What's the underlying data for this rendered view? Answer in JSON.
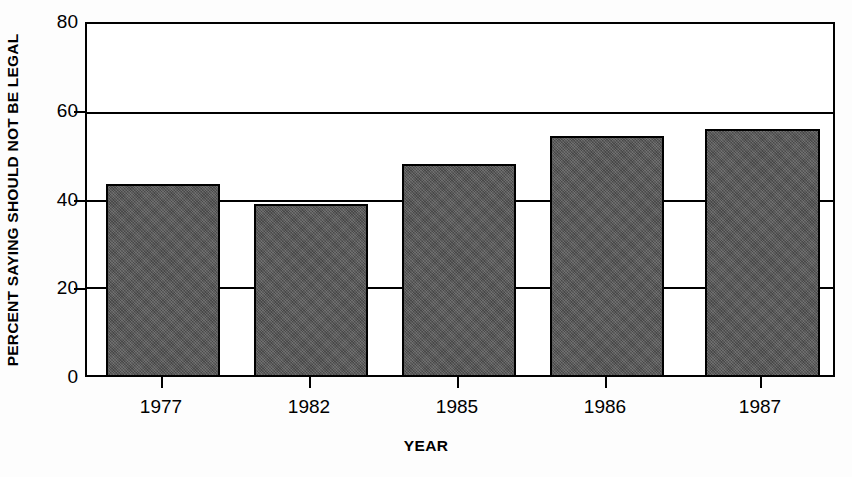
{
  "chart_data": {
    "type": "bar",
    "title": "",
    "categories": [
      "1977",
      "1982",
      "1985",
      "1986",
      "1987"
    ],
    "values": [
      43.5,
      39,
      48,
      54.5,
      56
    ],
    "xlabel": "YEAR",
    "ylabel": "PERCENT SAYING SHOULD NOT BE LEGAL",
    "ylim": [
      0,
      80
    ],
    "yticks": [
      0,
      20,
      40,
      60,
      80
    ],
    "ytick_labels": [
      "0",
      "20",
      "40",
      "60",
      "80"
    ],
    "gridlines": [
      20,
      40,
      60
    ],
    "grid": true,
    "legend": null,
    "bar_color": "#555555",
    "bar_edge_color": "#000000",
    "plot_background": "#ffffff",
    "axis_color": "#000000"
  }
}
